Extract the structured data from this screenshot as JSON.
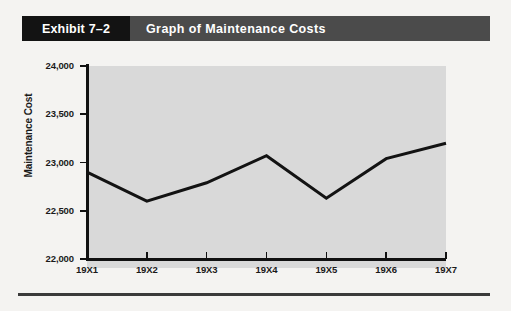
{
  "exhibit": {
    "number_label": "Exhibit 7–2",
    "title": "Graph of Maintenance Costs"
  },
  "colors": {
    "page_background": "#f4f3f1",
    "header_bar": "#4b4b4b",
    "header_number_block": "#131313",
    "header_text": "#ffffff",
    "plot_background": "#d9d9d9",
    "axis": "#111111",
    "data_line": "#131313"
  },
  "chart_data": {
    "type": "line",
    "title": "Graph of Maintenance Costs",
    "xlabel": "",
    "ylabel": "Maintenance Cost",
    "categories": [
      "19X1",
      "19X2",
      "19X3",
      "19X4",
      "19X5",
      "19X6",
      "19X7"
    ],
    "values": [
      22900,
      22600,
      22790,
      23070,
      22630,
      23040,
      23200
    ],
    "series": [
      {
        "name": "Maintenance Cost",
        "values": [
          22900,
          22600,
          22790,
          23070,
          22630,
          23040,
          23200
        ]
      }
    ],
    "ylim": [
      22000,
      24000
    ],
    "ytick_labels": [
      "22,000",
      "22,500",
      "23,000",
      "23,500",
      "24,000"
    ],
    "ytick_values": [
      22000,
      22500,
      23000,
      23500,
      24000
    ],
    "xtick_labels": [
      "19X1",
      "19X2",
      "19X3",
      "19X4",
      "19X5",
      "19X6",
      "19X7"
    ],
    "grid": false,
    "legend": false,
    "legend_position": "none"
  }
}
